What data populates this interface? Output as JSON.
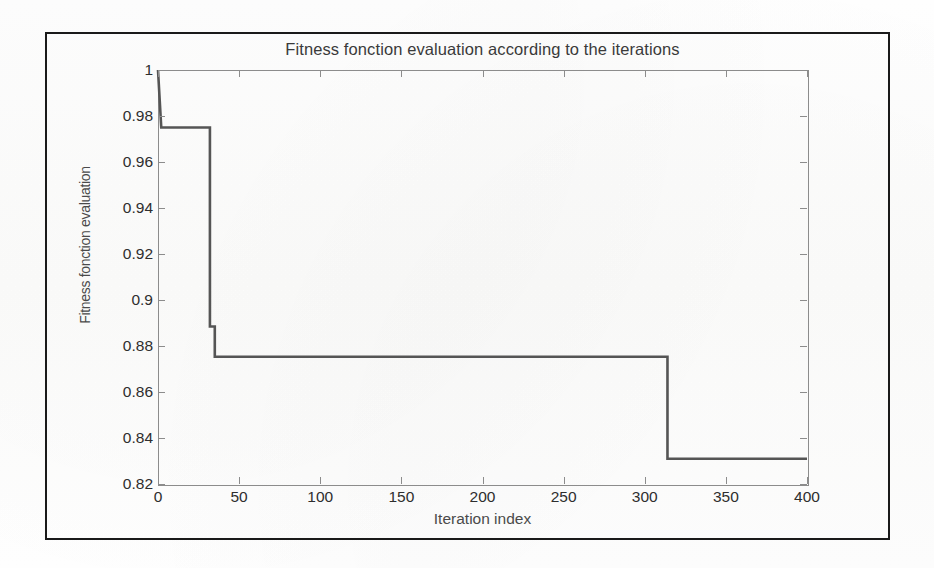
{
  "figure": {
    "title": "Fitness fonction evaluation according to the iterations",
    "xlabel": "Iteration index",
    "ylabel": "Fitness fonction evaluation",
    "line_color": "#555555",
    "axis_color": "#8c8c8c",
    "frame_color": "#1a1a1a",
    "background": "#fdfdfd"
  },
  "chart_data": {
    "type": "line",
    "title": "Fitness fonction evaluation according to the iterations",
    "xlabel": "Iteration index",
    "ylabel": "Fitness fonction evaluation",
    "xlim": [
      0,
      400
    ],
    "ylim": [
      0.82,
      1.0
    ],
    "xticks": [
      0,
      50,
      100,
      150,
      200,
      250,
      300,
      350,
      400
    ],
    "xticklabels": [
      "0",
      "50",
      "100",
      "150",
      "200",
      "250",
      "300",
      "350",
      "400"
    ],
    "yticks": [
      0.82,
      0.84,
      0.86,
      0.88,
      0.9,
      0.92,
      0.94,
      0.96,
      0.98,
      1.0
    ],
    "yticklabels": [
      "0.82",
      "0.84",
      "0.86",
      "0.88",
      "0.9",
      "0.92",
      "0.94",
      "0.96",
      "0.98",
      "1"
    ],
    "grid": false,
    "legend": null,
    "drawstyle": "steps-post",
    "series": [
      {
        "name": "best fitness",
        "x": [
          0,
          2,
          32,
          32,
          35,
          35,
          314,
          314,
          400
        ],
        "y": [
          1.0,
          0.975,
          0.975,
          0.8885,
          0.8885,
          0.8753,
          0.8753,
          0.831,
          0.831
        ]
      }
    ],
    "steps": [
      {
        "from_iteration": 0,
        "to_iteration": 2,
        "value": 1.0
      },
      {
        "from_iteration": 2,
        "to_iteration": 32,
        "value": 0.975
      },
      {
        "from_iteration": 32,
        "to_iteration": 35,
        "value": 0.8885
      },
      {
        "from_iteration": 35,
        "to_iteration": 314,
        "value": 0.8753
      },
      {
        "from_iteration": 314,
        "to_iteration": 400,
        "value": 0.831
      }
    ]
  }
}
